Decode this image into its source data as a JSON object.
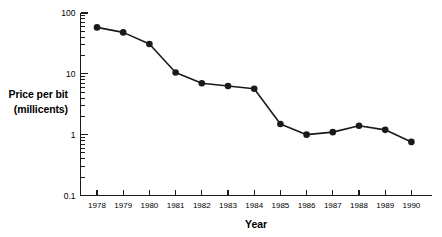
{
  "chart_data": {
    "type": "line",
    "title": "",
    "subtitle": "",
    "xlabel": "Year",
    "ylabel": "Price per bit (millicents)",
    "ylabel_line1": "Price per bit",
    "ylabel_line2": "(millicents)",
    "yscale": "log",
    "ylim": [
      0.1,
      100
    ],
    "ytick_labels": [
      "100",
      "10",
      "1",
      "0.1"
    ],
    "ytick_values": [
      100,
      10,
      1,
      0.1
    ],
    "grid": false,
    "legend": "none",
    "marker": "filled-circle",
    "categories": [
      "1978",
      "1979",
      "1980",
      "1981",
      "1982",
      "1983",
      "1984",
      "1985",
      "1986",
      "1987",
      "1988",
      "1989",
      "1990"
    ],
    "x": [
      1978,
      1979,
      1980,
      1981,
      1982,
      1983,
      1984,
      1985,
      1986,
      1987,
      1988,
      1989,
      1990
    ],
    "values": [
      58,
      48,
      31,
      10.5,
      7.0,
      6.3,
      5.7,
      1.5,
      1.0,
      1.1,
      1.4,
      1.2,
      0.76
    ],
    "series": [
      {
        "name": "Price per bit",
        "values": [
          58,
          48,
          31,
          10.5,
          7.0,
          6.3,
          5.7,
          1.5,
          1.0,
          1.1,
          1.4,
          1.2,
          0.76
        ]
      }
    ],
    "units": "millicents",
    "annotations": []
  },
  "colors": {
    "line": "#1a1a1a",
    "marker": "#1a1a1a",
    "axis": "#1a1a1a",
    "text": "#000000",
    "background": "#ffffff"
  }
}
